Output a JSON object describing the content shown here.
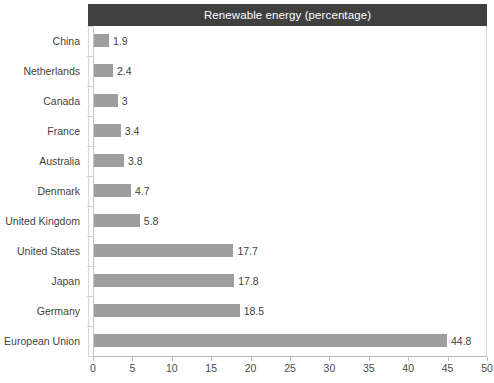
{
  "chart_data": {
    "type": "bar",
    "orientation": "horizontal",
    "title": "Renewable energy (percentage)",
    "xlabel": "",
    "ylabel": "",
    "xlim": [
      0,
      50
    ],
    "xticks": [
      0,
      5,
      10,
      15,
      20,
      25,
      30,
      35,
      40,
      45,
      50
    ],
    "grid": false,
    "legend": null,
    "categories": [
      "China",
      "Netherlands",
      "Canada",
      "France",
      "Australia",
      "Denmark",
      "United Kingdom",
      "United States",
      "Japan",
      "Germany",
      "European Union"
    ],
    "values": [
      1.9,
      2.4,
      3,
      3.4,
      3.8,
      4.7,
      5.8,
      17.7,
      17.8,
      18.5,
      44.8
    ],
    "value_labels": [
      "1.9",
      "2.4",
      "3",
      "3.4",
      "3.8",
      "4.7",
      "5.8",
      "17.7",
      "17.8",
      "18.5",
      "44.8"
    ],
    "colors": {
      "bar_fill": "#9e9e9e",
      "title_background": "#404040",
      "title_text": "#ffffff",
      "label_text": "#3f3f3f",
      "axis_line": "#b9b9b9",
      "plot_background": "#ffffff",
      "plot_border": "#d6d6d6"
    }
  }
}
